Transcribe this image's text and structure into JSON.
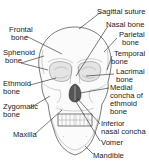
{
  "diagram": {
    "labels_left": [
      {
        "id": "frontal",
        "lines": [
          "Frontal",
          "bone"
        ]
      },
      {
        "id": "sphenoid",
        "lines": [
          "Sphenoid",
          "bone"
        ]
      },
      {
        "id": "ethmoid",
        "lines": [
          "Ethmoid",
          "bone"
        ]
      },
      {
        "id": "zygomatic",
        "lines": [
          "Zygomatic",
          "bone"
        ]
      },
      {
        "id": "maxilla",
        "lines": [
          "Maxilla"
        ]
      }
    ],
    "labels_right": [
      {
        "id": "sagittal-suture",
        "lines": [
          "Sagittal suture"
        ]
      },
      {
        "id": "nasal",
        "lines": [
          "Nasal bone"
        ]
      },
      {
        "id": "parietal",
        "lines": [
          "Parietal",
          "bone"
        ]
      },
      {
        "id": "temporal",
        "lines": [
          "Temporal",
          "bone"
        ]
      },
      {
        "id": "lacrimal",
        "lines": [
          "Lacrimal",
          "bone"
        ]
      },
      {
        "id": "medial-concha",
        "lines": [
          "Medial",
          "concha of",
          "ethmoid",
          "bone"
        ]
      },
      {
        "id": "inferior-nasal-concha",
        "lines": [
          "Inferior",
          "nasal concha"
        ]
      },
      {
        "id": "vomer",
        "lines": [
          "Vomer"
        ]
      },
      {
        "id": "mandible",
        "lines": [
          "Mandible"
        ]
      }
    ]
  }
}
